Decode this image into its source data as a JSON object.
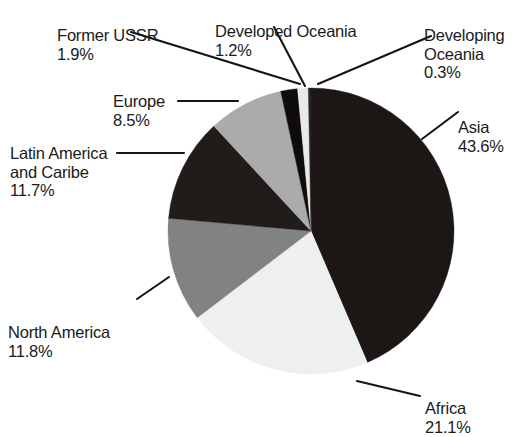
{
  "chart_data": {
    "type": "pie",
    "title": "",
    "subtitle": "",
    "xlabel": "",
    "ylabel": "",
    "legend_position": "none",
    "grid": false,
    "units": "percent",
    "start_angle_deg": 0,
    "direction": "clockwise",
    "categories": [
      "Asia",
      "Africa",
      "North America",
      "Latin America and Caribe",
      "Europe",
      "Former USSR",
      "Developed Oceania",
      "Developing Oceania"
    ],
    "values": [
      43.6,
      21.1,
      11.8,
      11.7,
      8.5,
      1.9,
      1.2,
      0.3
    ],
    "slices": [
      {
        "name": "Asia",
        "label": "Asia",
        "pct_text": "43.6%",
        "value": 43.6,
        "color": "#1c1614"
      },
      {
        "name": "Africa",
        "label": "Africa",
        "pct_text": "21.1%",
        "value": 21.1,
        "color": "#eef0f0"
      },
      {
        "name": "North America",
        "label": "North America",
        "pct_text": "11.8%",
        "value": 11.8,
        "color": "#808284"
      },
      {
        "name": "Latin America and Caribe",
        "label": "Latin America\nand Caribe",
        "pct_text": "11.7%",
        "value": 11.7,
        "color": "#211b19"
      },
      {
        "name": "Europe",
        "label": "Europe",
        "pct_text": "8.5%",
        "value": 8.5,
        "color": "#a9abac"
      },
      {
        "name": "Former USSR",
        "label": "Former USSR",
        "pct_text": "1.9%",
        "value": 1.9,
        "color": "#100c0b"
      },
      {
        "name": "Developed Oceania",
        "label": "Developed Oceania",
        "pct_text": "1.2%",
        "value": 1.2,
        "color": "#e7e9ea"
      },
      {
        "name": "Developing Oceania",
        "label": "Developing\nOceania",
        "pct_text": "0.3%",
        "value": 0.3,
        "color": "#2a2422"
      }
    ]
  },
  "labels": {
    "former_ussr": {
      "name": "Former USSR",
      "pct": "1.9%"
    },
    "developed_oceania": {
      "name": "Developed Oceania",
      "pct": "1.2%"
    },
    "developing_oceania": {
      "name": "Developing\nOceania",
      "pct": "0.3%"
    },
    "europe": {
      "name": "Europe",
      "pct": "8.5%"
    },
    "asia": {
      "name": "Asia",
      "pct": "43.6%"
    },
    "latin_america": {
      "name": "Latin America\nand Caribe",
      "pct": "11.7%"
    },
    "north_america": {
      "name": "North America",
      "pct": "11.8%"
    },
    "africa": {
      "name": "Africa",
      "pct": "21.1%"
    }
  },
  "colors": {
    "background": "#ffffff",
    "text": "#1a1a1a",
    "leader_line": "#151515",
    "black_slice": "#1c1614",
    "dark_slice": "#211b19",
    "mid_gray_slice": "#808284",
    "light_gray_slice": "#a9abac",
    "near_white_slice": "#eef0f0"
  }
}
